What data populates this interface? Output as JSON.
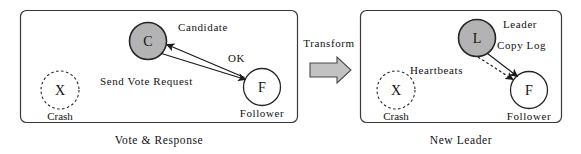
{
  "figure": {
    "panels": [
      {
        "id": "left",
        "caption": "Vote  &  Response",
        "nodes": [
          {
            "id": "crash-left",
            "glyph": "X",
            "role_label": "Crash",
            "style": "dashed-open"
          },
          {
            "id": "candidate",
            "glyph": "C",
            "role_label": "Candidate",
            "style": "gray-filled"
          },
          {
            "id": "follower-left",
            "glyph": "F",
            "role_label": "Follower",
            "style": "open"
          }
        ],
        "edges": [
          {
            "id": "send-vote-request",
            "label": "Send  Vote  Request",
            "from": "C",
            "to": "F",
            "style": "solid"
          },
          {
            "id": "ok",
            "label": "OK",
            "from": "F",
            "to": "C",
            "style": "solid"
          }
        ]
      },
      {
        "id": "right",
        "caption": "New  Leader",
        "nodes": [
          {
            "id": "crash-right",
            "glyph": "X",
            "role_label": "Crash",
            "style": "dashed-open"
          },
          {
            "id": "leader",
            "glyph": "L",
            "role_label": "Leader",
            "style": "gray-filled"
          },
          {
            "id": "follower-right",
            "glyph": "F",
            "role_label": "Follower",
            "style": "open"
          }
        ],
        "edges": [
          {
            "id": "copy-log",
            "label": "Copy  Log",
            "from": "L",
            "to": "F",
            "style": "solid"
          },
          {
            "id": "heartbeats",
            "label": "Heartbeats",
            "from": "L",
            "to": "F",
            "style": "dashed"
          }
        ]
      }
    ],
    "transform": {
      "label": "Transform",
      "arrow_direction": "right",
      "arrow_fill": "#c2c2c2"
    },
    "colors": {
      "background": "#ffffff",
      "panel_border": "#3a3a3a",
      "node_fill_active": "#b3b3b3",
      "node_fill_idle": "#ffffff",
      "node_stroke": "#262626",
      "edge_stroke": "#1a1a1a",
      "text": "#111111"
    }
  }
}
